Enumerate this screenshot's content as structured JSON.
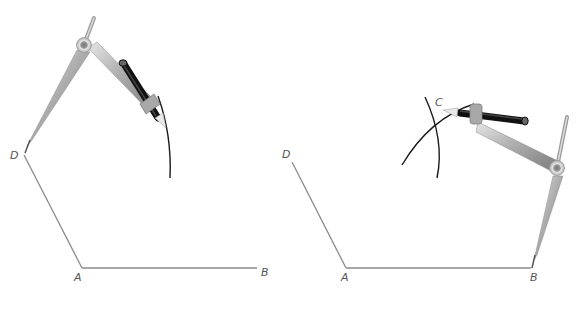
{
  "figure": {
    "left_panel": {
      "labels": {
        "D": "D",
        "A": "A",
        "B": "B"
      },
      "points": {
        "D": [
          24,
          155
        ],
        "A": [
          82,
          268
        ],
        "B": [
          257,
          268
        ]
      }
    },
    "right_panel": {
      "labels": {
        "D": "D",
        "A": "A",
        "B": "B",
        "C": "C"
      },
      "points": {
        "D": [
          292,
          162
        ],
        "A": [
          346,
          268
        ],
        "B": [
          531,
          268
        ],
        "C": [
          437,
          109
        ]
      }
    },
    "colors": {
      "segment": "#8a8a8a",
      "arc": "#1a1a1a",
      "label": "#555555",
      "compass_metal": "#b8b8b8",
      "pencil": "#111111"
    }
  }
}
